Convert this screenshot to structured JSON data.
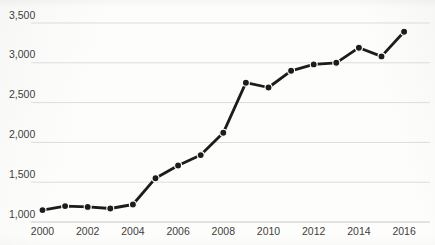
{
  "chart_data": {
    "type": "line",
    "title": "",
    "xlabel": "",
    "ylabel": "",
    "x": [
      2000,
      2001,
      2002,
      2003,
      2004,
      2005,
      2006,
      2007,
      2008,
      2009,
      2010,
      2011,
      2012,
      2013,
      2014,
      2015,
      2016
    ],
    "values": [
      1150,
      1200,
      1190,
      1170,
      1220,
      1550,
      1710,
      1840,
      2120,
      2750,
      2690,
      2900,
      2980,
      3000,
      3190,
      3080,
      3390
    ],
    "ylim": [
      1000,
      3500
    ],
    "y_tick_step": 500,
    "y_ticks": [
      {
        "value": 1000,
        "label": "1,000"
      },
      {
        "value": 1500,
        "label": "1,500"
      },
      {
        "value": 2000,
        "label": "2,000"
      },
      {
        "value": 2500,
        "label": "2,500"
      },
      {
        "value": 3000,
        "label": "3,000"
      },
      {
        "value": 3500,
        "label": "3,500"
      }
    ],
    "x_ticks": [
      {
        "value": 2000,
        "label": "2000"
      },
      {
        "value": 2002,
        "label": "2002"
      },
      {
        "value": 2004,
        "label": "2004"
      },
      {
        "value": 2006,
        "label": "2006"
      },
      {
        "value": 2008,
        "label": "2008"
      },
      {
        "value": 2010,
        "label": "2010"
      },
      {
        "value": 2012,
        "label": "2012"
      },
      {
        "value": 2014,
        "label": "2014"
      },
      {
        "value": 2016,
        "label": "2016"
      }
    ],
    "grid": "horizontal",
    "legend": "none",
    "marker": "filled-circle",
    "colors": {
      "line": "#1c1c1c",
      "marker": "#1c1c1c",
      "marker_halo": "#fdfdfc",
      "gridline": "#dcdcdc",
      "bottom_gridline": "#c9c9c9",
      "tick_label": "#3d3d3d",
      "background": "#fdfdfc"
    }
  }
}
